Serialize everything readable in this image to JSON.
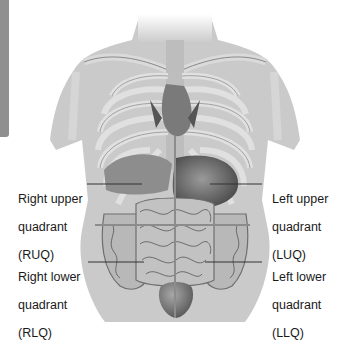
{
  "figure": {
    "colors": {
      "side_tab": "#8f8f8f",
      "body_fill": "#c9c9c9",
      "bone": "#dcdcdc",
      "bone_stroke": "#8a8a8a",
      "organ_dark": "#5a5a5a",
      "quadrant_line": "#8c8c8c",
      "leader_line": "#333333",
      "text": "#1a1a1a"
    }
  },
  "labels": {
    "ruq": {
      "line1": "Right upper",
      "line2": "quadrant",
      "line3": "(RUQ)"
    },
    "luq": {
      "line1": "Left upper",
      "line2": "quadrant",
      "line3": "(LUQ)"
    },
    "rlq": {
      "line1": "Right lower",
      "line2": "quadrant",
      "line3": "(RLQ)"
    },
    "llq": {
      "line1": "Left lower",
      "line2": "quadrant",
      "line3": "(LLQ)"
    }
  }
}
